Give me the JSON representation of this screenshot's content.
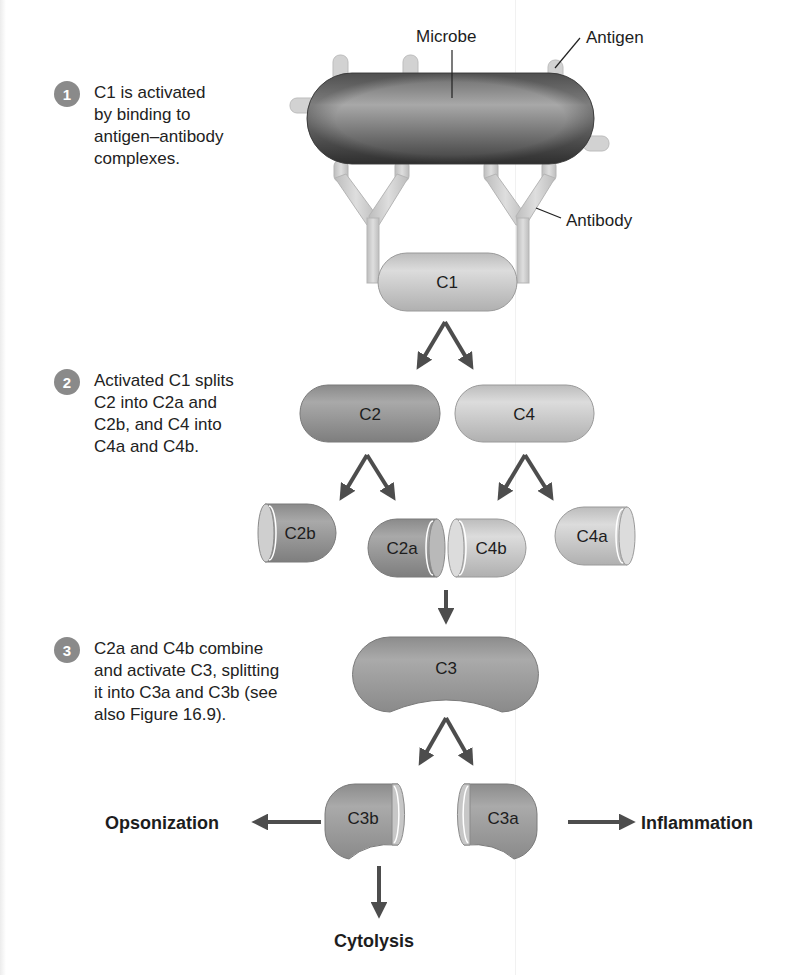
{
  "figure": {
    "steps": [
      {
        "number": "1",
        "text": "C1 is activated\nby binding to\nantigen–antibody\ncomplexes."
      },
      {
        "number": "2",
        "text": "Activated C1 splits\nC2 into C2a and\nC2b, and C4 into\nC4a and C4b."
      },
      {
        "number": "3",
        "text": "C2a and C4b combine\nand activate C3, splitting\nit into C3a and C3b (see\nalso Figure 16.9)."
      }
    ],
    "callouts": {
      "microbe": "Microbe",
      "antigen": "Antigen",
      "antibody": "Antibody"
    },
    "components": {
      "c1": "C1",
      "c2": "C2",
      "c4": "C4",
      "c2b": "C2b",
      "c2a": "C2a",
      "c4b": "C4b",
      "c4a": "C4a",
      "c3": "C3",
      "c3b": "C3b",
      "c3a": "C3a"
    },
    "outcomes": {
      "opsonization": "Opsonization",
      "inflammation": "Inflammation",
      "cytolysis": "Cytolysis"
    },
    "colors": {
      "microbe_dark": "#4a4a4a",
      "microbe_light": "#9a9a9a",
      "c2_fill": "#8f8f8f",
      "c4_fill": "#c9c9c9",
      "c1_fill": "#bdbdbd",
      "antibody_fill": "#cfcfcf",
      "arrow": "#4d4d4d",
      "step_badge": "#8a8a8a"
    }
  }
}
